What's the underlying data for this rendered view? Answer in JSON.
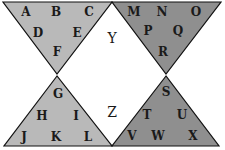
{
  "diagram": {
    "colors": {
      "left_triangles": "#b9b9b9",
      "right_triangles": "#8f8f8f",
      "outline": "#111111",
      "center": "#ffffff",
      "text": "#1a1a1a"
    },
    "top_left_triangle": {
      "letters": [
        "A",
        "B",
        "C",
        "D",
        "E",
        "F"
      ]
    },
    "top_right_triangle": {
      "letters": [
        "M",
        "N",
        "O",
        "P",
        "Q",
        "R"
      ]
    },
    "bottom_left_triangle": {
      "letters": [
        "G",
        "H",
        "I",
        "J",
        "K",
        "L"
      ]
    },
    "bottom_right_triangle": {
      "letters": [
        "S",
        "T",
        "U",
        "V",
        "W",
        "X"
      ]
    },
    "center_letters": [
      "Y",
      "Z"
    ]
  }
}
